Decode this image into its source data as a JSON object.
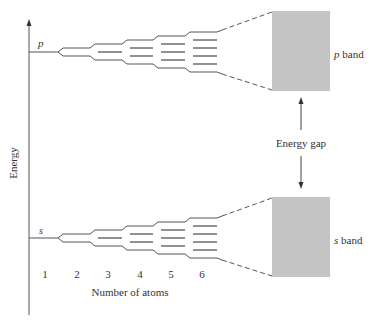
{
  "diagram": {
    "axis_label": "Energy",
    "x_axis_label": "Number of atoms",
    "atom_counts": [
      "1",
      "2",
      "3",
      "4",
      "5",
      "6"
    ],
    "levels": [
      {
        "orbital": "p",
        "label": "p",
        "band_label_italic": "p",
        "band_label_rest": " band",
        "y": 52
      },
      {
        "orbital": "s",
        "label": "s",
        "band_label_italic": "s",
        "band_label_rest": " band",
        "y": 238
      }
    ],
    "gap_label": "Energy gap",
    "colors": {
      "line": "#555555",
      "band_fill": "#9a9a9a",
      "text": "#333333"
    }
  }
}
